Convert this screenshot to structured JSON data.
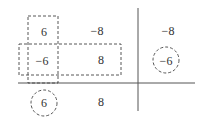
{
  "diagram": {
    "cells": [
      {
        "row": 0,
        "col": 0,
        "value": "6"
      },
      {
        "row": 0,
        "col": 1,
        "value": "−8"
      },
      {
        "row": 0,
        "col": 2,
        "value": "−8"
      },
      {
        "row": 1,
        "col": 0,
        "value": "−6"
      },
      {
        "row": 1,
        "col": 1,
        "value": "8"
      },
      {
        "row": 1,
        "col": 2,
        "value": "−6"
      },
      {
        "row": 2,
        "col": 0,
        "value": "6"
      },
      {
        "row": 2,
        "col": 1,
        "value": "8"
      }
    ],
    "colors": {
      "line": "#555555",
      "dash": "#444444",
      "text": "#333333",
      "background": "#ffffff"
    }
  }
}
